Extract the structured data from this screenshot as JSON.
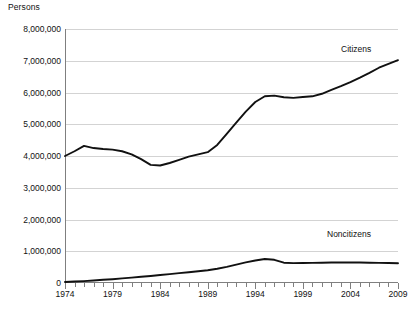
{
  "chart_data": {
    "type": "line",
    "title": "",
    "ylabel": "Persons",
    "xlabel": "",
    "ylim": [
      0,
      8000000
    ],
    "xlim": [
      1974,
      2009
    ],
    "grid": true,
    "legend_position": "inline-annotations",
    "ytick_labels": [
      "8,000,000",
      "7,000,000",
      "6,000,000",
      "5,000,000",
      "4,000,000",
      "3,000,000",
      "2,000,000",
      "1,000,000",
      "0"
    ],
    "ytick_values": [
      8000000,
      7000000,
      6000000,
      5000000,
      4000000,
      3000000,
      2000000,
      1000000,
      0
    ],
    "xtick_labels": [
      "1974",
      "1979",
      "1984",
      "1989",
      "1994",
      "1999",
      "2004",
      "2009"
    ],
    "xtick_values": [
      1974,
      1979,
      1984,
      1989,
      1994,
      1999,
      2004,
      2009
    ],
    "x": [
      1974,
      1975,
      1976,
      1977,
      1978,
      1979,
      1980,
      1981,
      1982,
      1983,
      1984,
      1985,
      1986,
      1987,
      1988,
      1989,
      1990,
      1991,
      1992,
      1993,
      1994,
      1995,
      1996,
      1997,
      1998,
      1999,
      2000,
      2001,
      2002,
      2003,
      2004,
      2005,
      2006,
      2007,
      2008,
      2009
    ],
    "series": [
      {
        "name": "Citizens",
        "color": "#111111",
        "values": [
          4000000,
          4150000,
          4320000,
          4250000,
          4220000,
          4200000,
          4150000,
          4050000,
          3900000,
          3720000,
          3700000,
          3780000,
          3880000,
          3980000,
          4050000,
          4120000,
          4350000,
          4700000,
          5050000,
          5400000,
          5700000,
          5880000,
          5900000,
          5850000,
          5830000,
          5860000,
          5880000,
          5960000,
          6080000,
          6200000,
          6330000,
          6470000,
          6620000,
          6780000,
          6900000,
          7020000
        ]
      },
      {
        "name": "Noncitizens",
        "color": "#111111",
        "values": [
          30000,
          45000,
          60000,
          80000,
          100000,
          120000,
          145000,
          170000,
          195000,
          220000,
          250000,
          280000,
          310000,
          340000,
          370000,
          400000,
          450000,
          510000,
          580000,
          650000,
          710000,
          755000,
          730000,
          640000,
          625000,
          630000,
          635000,
          640000,
          645000,
          648000,
          650000,
          645000,
          640000,
          635000,
          628000,
          620000
        ]
      }
    ],
    "annotations": [
      {
        "label": "Citizens",
        "series": "Citizens"
      },
      {
        "label": "Noncitizens",
        "series": "Noncitizens"
      }
    ]
  },
  "caption": {
    "label": "",
    "text": ""
  }
}
